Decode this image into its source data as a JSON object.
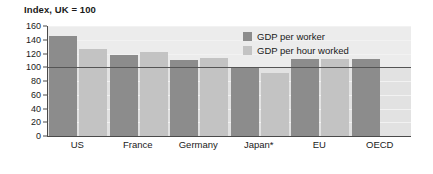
{
  "chart_data": {
    "type": "bar",
    "title": "Index, UK = 100",
    "subtitle": "",
    "xlabel": "",
    "ylabel": "",
    "ylim": [
      0,
      160
    ],
    "yticks": [
      0,
      20,
      40,
      60,
      80,
      100,
      120,
      140,
      160
    ],
    "grid": true,
    "legend_position": "top-right",
    "reference_line": 100,
    "categories": [
      "US",
      "France",
      "Germany",
      "Japan*",
      "EU",
      "OECD"
    ],
    "series": [
      {
        "name": "GDP per worker",
        "color": "#8c8c8c",
        "values": [
          145,
          118,
          110,
          101,
          112,
          112
        ]
      },
      {
        "name": "GDP per hour worked",
        "color": "#c3c3c3",
        "values": [
          126,
          122,
          114,
          92,
          112,
          null
        ]
      }
    ],
    "footnote": ""
  },
  "legend": {
    "items": [
      {
        "label": "GDP per worker"
      },
      {
        "label": "GDP per hour worked"
      }
    ]
  }
}
